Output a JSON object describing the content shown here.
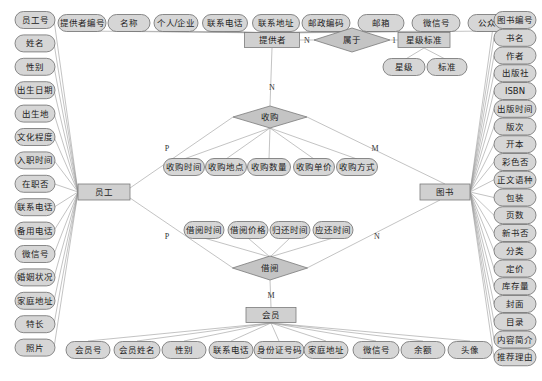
{
  "diagram": {
    "type": "ER diagram",
    "colors": {
      "attribute_fill": "#d6d6d6",
      "entity_fill": "#d0d0d0",
      "relationship_fill": "#c4c4c4",
      "line": "#9a9a9a"
    },
    "entities": {
      "provider": {
        "label": "提供者"
      },
      "star_standard": {
        "label": "星级标准"
      },
      "employee": {
        "label": "员工"
      },
      "book": {
        "label": "图书"
      },
      "member": {
        "label": "会员"
      }
    },
    "relationships": {
      "belongs": {
        "label": "属于",
        "card_left": "N",
        "card_right": "1"
      },
      "purchase": {
        "label": "收购",
        "card_top": "N",
        "card_left": "P",
        "card_right": "M"
      },
      "borrow": {
        "label": "借阅",
        "card_left": "P",
        "card_right": "N",
        "card_bottom": "M"
      }
    },
    "provider_attributes": [
      "提供者编号",
      "名称",
      "个人/企业",
      "联系电话",
      "联系地址",
      "邮政编码",
      "邮箱",
      "微信号",
      "公众号"
    ],
    "star_standard_attributes": [
      "星级",
      "标准"
    ],
    "employee_attributes": [
      "员工号",
      "姓名",
      "性别",
      "出生日期",
      "出生地",
      "文化程度",
      "入职时间",
      "在职否",
      "联系电话",
      "备用电话",
      "微信号",
      "婚姻状况",
      "家庭地址",
      "特长",
      "照片"
    ],
    "book_attributes": [
      "图书编号",
      "书名",
      "作者",
      "出版社",
      "ISBN",
      "出版时间",
      "版次",
      "开本",
      "彩色否",
      "正文语种",
      "包装",
      "页数",
      "新书否",
      "分类",
      "定价",
      "库存量",
      "封面",
      "目录",
      "内容简介",
      "推荐理由"
    ],
    "purchase_attributes": [
      "收购时间",
      "收购地点",
      "收购数量",
      "收购单价",
      "收购方式"
    ],
    "borrow_attributes": [
      "借阅时间",
      "借阅价格",
      "归还时间",
      "应还时间"
    ],
    "member_attributes": [
      "会员号",
      "会员姓名",
      "性别",
      "联系电话",
      "身份证号码",
      "家庭地址",
      "微信号",
      "余额",
      "头像"
    ]
  }
}
